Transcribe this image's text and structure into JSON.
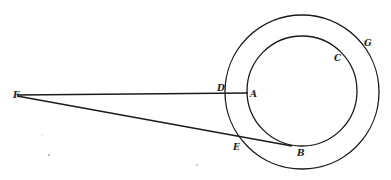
{
  "diagram": {
    "type": "geometric-figure",
    "points": {
      "F": {
        "label": "F",
        "x": 17,
        "y": 95
      },
      "D": {
        "label": "D",
        "x": 226,
        "y": 93
      },
      "A": {
        "label": "A",
        "x": 248,
        "y": 93
      },
      "E": {
        "label": "E",
        "x": 238,
        "y": 139
      },
      "B": {
        "label": "B",
        "x": 290,
        "y": 146
      },
      "C": {
        "label": "C",
        "x": 336,
        "y": 56
      },
      "G": {
        "label": "G",
        "x": 368,
        "y": 42
      }
    },
    "circles": {
      "inner": {
        "cx": 302,
        "cy": 91,
        "r": 55,
        "label": "C"
      },
      "outer": {
        "cx": 302,
        "cy": 92,
        "r": 77,
        "label": "G"
      }
    },
    "lines": [
      {
        "from": "F",
        "to": "A"
      },
      {
        "from": "F",
        "to": "B"
      }
    ],
    "colors": {
      "stroke": "#1a1a1a",
      "background": "#ffffff"
    }
  }
}
